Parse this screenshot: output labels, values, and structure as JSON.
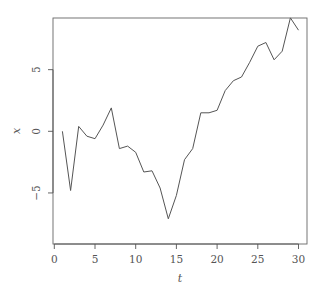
{
  "chart_data": {
    "type": "line",
    "title": "",
    "xlabel": "t",
    "ylabel": "x",
    "x": [
      1,
      2,
      3,
      4,
      5,
      6,
      7,
      8,
      9,
      10,
      11,
      12,
      13,
      14,
      15,
      16,
      17,
      18,
      19,
      20,
      21,
      22,
      23,
      24,
      25,
      26,
      27,
      28,
      29,
      30
    ],
    "series": [
      {
        "name": "x",
        "values": [
          0.0,
          -4.8,
          0.4,
          -0.4,
          -0.6,
          0.5,
          1.9,
          -1.4,
          -1.2,
          -1.7,
          -3.3,
          -3.2,
          -4.6,
          -7.1,
          -5.2,
          -2.3,
          -1.4,
          1.5,
          1.5,
          1.7,
          3.3,
          4.1,
          4.4,
          5.6,
          6.9,
          7.2,
          5.8,
          6.5,
          9.2,
          8.2
        ]
      }
    ],
    "xticks": [
      0,
      5,
      10,
      15,
      20,
      25,
      30
    ],
    "yticks": [
      -5,
      0,
      5
    ],
    "xlim": [
      -0.16,
      31.0
    ],
    "ylim": [
      -9.1,
      9.2
    ],
    "grid": false,
    "legend": null
  },
  "layout": {
    "plot_left": 53,
    "plot_right": 307,
    "plot_top": 18,
    "plot_bottom": 244,
    "x_origin_px": 54.3,
    "x_px_per_unit": 8.14,
    "y_origin_px": 131.3,
    "y_px_per_unit": 12.33,
    "line_color": "#555555"
  }
}
